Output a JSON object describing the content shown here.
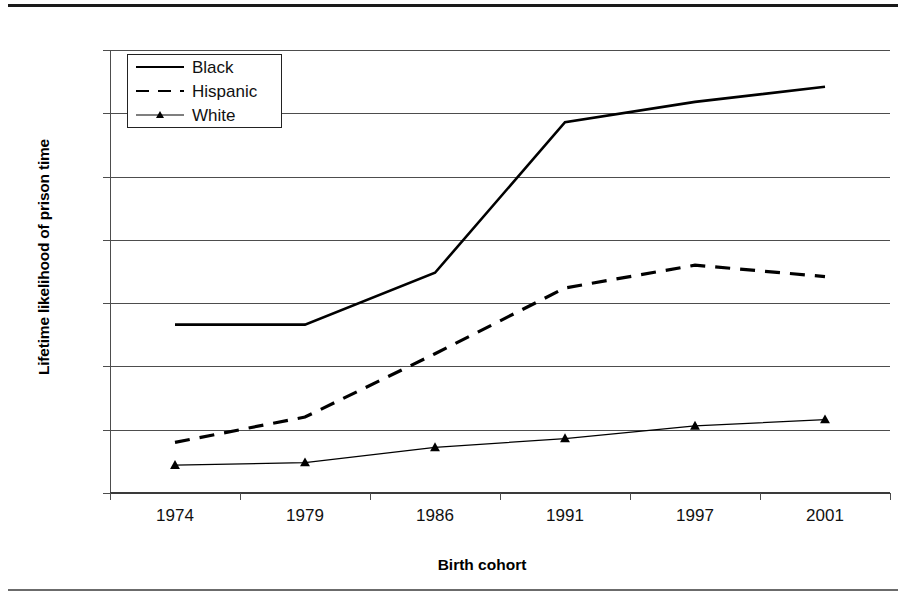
{
  "chart_data": {
    "type": "line",
    "title": "",
    "xlabel": "Birth cohort",
    "ylabel": "Lifetime likelihood of prison time",
    "categories": [
      "1974",
      "1979",
      "1986",
      "1991",
      "1997",
      "2001"
    ],
    "ylim": [
      0,
      35
    ],
    "yticks": [
      "0",
      "5",
      "10",
      "15",
      "20",
      "25",
      "30",
      "35"
    ],
    "grid": true,
    "legend_position": "top-left-inside",
    "series": [
      {
        "name": "Black",
        "style": "solid",
        "marker": "none",
        "color": "#000000",
        "values": [
          13.3,
          13.3,
          17.4,
          29.3,
          30.9,
          32.1
        ]
      },
      {
        "name": "Hispanic",
        "style": "dashed",
        "marker": "none",
        "color": "#000000",
        "values": [
          4.0,
          6.0,
          11.0,
          16.2,
          18.0,
          17.1
        ]
      },
      {
        "name": "White",
        "style": "solid-thin",
        "marker": "triangle",
        "color": "#000000",
        "values": [
          2.2,
          2.4,
          3.6,
          4.3,
          5.3,
          5.8
        ]
      }
    ]
  },
  "axis": {
    "y_tick_labels": [
      "35",
      "30",
      "25",
      "20",
      "15",
      "10",
      "5",
      "0"
    ],
    "x_tick_labels": [
      "1974",
      "1979",
      "1986",
      "1991",
      "1997",
      "2001"
    ]
  },
  "legend": {
    "items": [
      {
        "label": "Black"
      },
      {
        "label": "Hispanic"
      },
      {
        "label": "White"
      }
    ]
  }
}
